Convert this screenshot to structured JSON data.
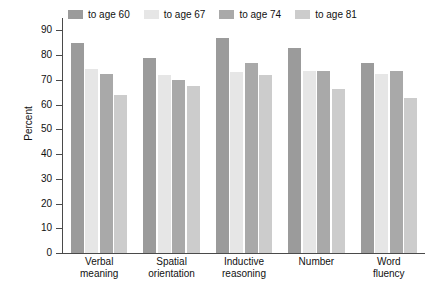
{
  "chart_data": {
    "type": "bar",
    "title": "",
    "xlabel": "",
    "ylabel": "Percent",
    "ylim": [
      0,
      95
    ],
    "yticks": [
      0,
      10,
      20,
      30,
      40,
      50,
      60,
      70,
      80,
      90
    ],
    "grid": false,
    "legend_position": "top",
    "categories": [
      "Verbal meaning",
      "Spatial orientation",
      "Inductive reasoning",
      "Number",
      "Word fluency"
    ],
    "category_lines": [
      [
        "Verbal",
        "meaning"
      ],
      [
        "Spatial",
        "orientation"
      ],
      [
        "Inductive",
        "reasoning"
      ],
      [
        "Number",
        ""
      ],
      [
        "Word",
        "fluency"
      ]
    ],
    "series": [
      {
        "name": "to age 60",
        "color": "#9b9b9b",
        "values": [
          85,
          79,
          87,
          83,
          77
        ]
      },
      {
        "name": "to age 67",
        "color": "#e6e6e6",
        "values": [
          74.5,
          72,
          73,
          73.5,
          72.5
        ]
      },
      {
        "name": "to age 74",
        "color": "#a9a9a9",
        "values": [
          72.5,
          70,
          77,
          73.5,
          73.5
        ]
      },
      {
        "name": "to age 81",
        "color": "#cccccc",
        "values": [
          64,
          67.5,
          72,
          66.5,
          62.5
        ]
      }
    ]
  },
  "legend": {
    "items": [
      {
        "label": "to age 60"
      },
      {
        "label": "to age 67"
      },
      {
        "label": "to age 74"
      },
      {
        "label": "to age 81"
      }
    ]
  },
  "axis": {
    "y_title": "Percent"
  }
}
